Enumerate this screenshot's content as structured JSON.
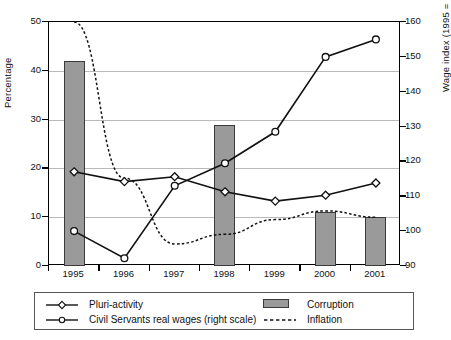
{
  "chart_data": {
    "type": "line",
    "title": "",
    "xlabel": "",
    "ylabel": "Percentage",
    "y2label": "Wage index (1995 = 100)",
    "categories": [
      "1995",
      "1996",
      "1997",
      "1998",
      "1999",
      "2000",
      "2001"
    ],
    "ylim": [
      0,
      50
    ],
    "yticks": [
      0,
      10,
      20,
      30,
      40,
      50
    ],
    "y2lim": [
      90,
      160
    ],
    "y2ticks": [
      90,
      100,
      110,
      120,
      130,
      140,
      150,
      160
    ],
    "grid": true,
    "legend_position": "below-plot",
    "series": [
      {
        "name": "Pluri-activity",
        "type": "line",
        "axis": "left",
        "marker": "open-diamond",
        "values": [
          19.3,
          17.3,
          18.3,
          15.2,
          13.3,
          14.5,
          17.0
        ]
      },
      {
        "name": "Civil Servants real wages (right scale)",
        "type": "line",
        "axis": "right",
        "marker": "open-circle",
        "values": [
          100.0,
          92.2,
          113.0,
          119.5,
          128.5,
          150.0,
          155.0
        ]
      },
      {
        "name": "Corruption",
        "type": "bar",
        "axis": "left",
        "values": [
          42.0,
          null,
          null,
          29.0,
          null,
          11.0,
          10.0
        ]
      },
      {
        "name": "Inflation",
        "type": "line",
        "axis": "left",
        "style": "dotted",
        "values": [
          50.0,
          18.0,
          4.5,
          6.5,
          9.5,
          11.3,
          10.0
        ]
      }
    ]
  },
  "legend": {
    "items": [
      {
        "label": "Pluri-activity",
        "symbol": "line-open-diamond"
      },
      {
        "label": "Civil Servants real wages (right scale)",
        "symbol": "line-open-circle"
      },
      {
        "label": "Corruption",
        "symbol": "gray-swatch"
      },
      {
        "label": "Inflation",
        "symbol": "dotted-line"
      }
    ]
  },
  "colors": {
    "bar_fill": "#9a9a9a",
    "bar_edge": "#3a3a3a",
    "line": "#111111",
    "grid": "#b9b9b9",
    "axis": "#000000"
  }
}
